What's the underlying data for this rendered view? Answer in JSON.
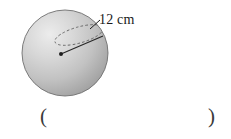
{
  "figure": {
    "shape_name": "sphere",
    "label": "12 cm",
    "measurement": {
      "value": 12,
      "unit": "cm",
      "quantity": "radius"
    },
    "colors": {
      "sphere_light": "#e8e8e8",
      "sphere_mid": "#c9c9c9",
      "sphere_dark": "#a3a3a3",
      "outline": "#6e6e6e",
      "radius_line": "#262626",
      "dashed_arc": "#555555",
      "text": "#1a1a1a",
      "background": "#ffffff"
    },
    "geometry": {
      "center_x": 65,
      "center_y": 53,
      "radius_px": 43,
      "dot_x": 61,
      "dot_y": 54,
      "radius_end_x": 103,
      "radius_end_y": 36
    }
  },
  "answer_blank": {
    "open_paren": "(",
    "close_paren": ")",
    "value": ""
  }
}
